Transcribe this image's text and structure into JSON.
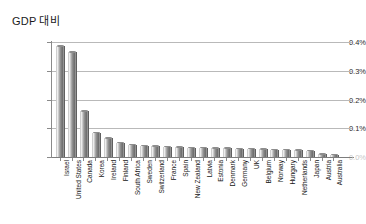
{
  "chart_data": {
    "type": "bar",
    "title": "GDP 대비",
    "xlabel": "",
    "ylabel": "",
    "ylim": [
      0,
      0.4
    ],
    "ytick_labels": [
      "0.4%",
      "0.3%",
      "0.2%",
      "0.1%",
      "0.0%"
    ],
    "ytick_values": [
      0.4,
      0.3,
      0.2,
      0.1,
      0.0
    ],
    "grid": true,
    "legend": "none",
    "orientation": "vertical",
    "value_unit": "%",
    "categories": [
      "Israel",
      "United States",
      "Canada",
      "Korea",
      "Ireland",
      "Finland",
      "South Africa",
      "Sweden",
      "Switzerland",
      "France",
      "Spain",
      "New Zealand",
      "Latvia",
      "Estonia",
      "Denmark",
      "Germany",
      "UK",
      "Belgium",
      "Norway",
      "Hungary",
      "Netherlands",
      "Japan",
      "Austria",
      "Australia"
    ],
    "values": [
      0.385,
      0.365,
      0.16,
      0.085,
      0.065,
      0.05,
      0.043,
      0.04,
      0.038,
      0.036,
      0.034,
      0.033,
      0.032,
      0.031,
      0.03,
      0.029,
      0.028,
      0.027,
      0.026,
      0.025,
      0.024,
      0.022,
      0.01,
      0.008
    ],
    "series_name": "GDP 대비"
  },
  "colors": {
    "bar_light": "#e2e2e2",
    "bar_mid": "#9a9a9a",
    "bar_dark": "#6f6f6f",
    "gridline": "#b9b9b9",
    "axis": "#7d7d7d",
    "text": "#141414",
    "background": "#ffffff"
  }
}
